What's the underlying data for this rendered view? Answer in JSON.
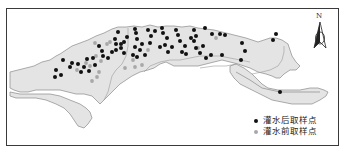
{
  "map": {
    "north_label": "N",
    "colors": {
      "region_fill": "#e4e4e4",
      "region_stroke": "#8a8a8a",
      "after_point": "#111111",
      "before_point": "#a8a8a8",
      "frame": "#3a3a3a"
    },
    "legend": [
      {
        "label": "灌水后取样点",
        "symbol": "black-dot",
        "color": "#111111"
      },
      {
        "label": "灌水前取样点",
        "symbol": "gray-dot",
        "color": "#a8a8a8"
      }
    ],
    "points_after": [
      [
        63,
        60
      ],
      [
        78,
        64
      ],
      [
        84,
        67
      ],
      [
        81,
        72
      ],
      [
        89,
        71
      ],
      [
        95,
        65
      ],
      [
        103,
        56
      ],
      [
        102,
        51
      ],
      [
        99,
        46
      ],
      [
        87,
        59
      ],
      [
        93,
        58
      ],
      [
        70,
        67
      ],
      [
        56,
        70
      ],
      [
        72,
        63
      ],
      [
        55,
        77
      ],
      [
        61,
        75
      ],
      [
        108,
        58
      ],
      [
        112,
        52
      ],
      [
        115,
        39
      ],
      [
        118,
        32
      ],
      [
        116,
        50
      ],
      [
        121,
        48
      ],
      [
        124,
        42
      ],
      [
        127,
        37
      ],
      [
        133,
        55
      ],
      [
        135,
        47
      ],
      [
        137,
        39
      ],
      [
        136,
        33
      ],
      [
        135,
        29
      ],
      [
        137,
        57
      ],
      [
        140,
        50
      ],
      [
        142,
        44
      ],
      [
        145,
        55
      ],
      [
        150,
        43
      ],
      [
        151,
        36
      ],
      [
        155,
        31
      ],
      [
        160,
        47
      ],
      [
        163,
        33
      ],
      [
        162,
        28
      ],
      [
        165,
        45
      ],
      [
        167,
        38
      ],
      [
        168,
        52
      ],
      [
        172,
        47
      ],
      [
        178,
        35
      ],
      [
        176,
        30
      ],
      [
        180,
        41
      ],
      [
        185,
        46
      ],
      [
        182,
        52
      ],
      [
        186,
        54
      ],
      [
        191,
        38
      ],
      [
        194,
        30
      ],
      [
        196,
        36
      ],
      [
        194,
        41
      ],
      [
        196,
        48
      ],
      [
        200,
        53
      ],
      [
        203,
        46
      ],
      [
        206,
        58
      ],
      [
        211,
        55
      ],
      [
        205,
        28
      ],
      [
        212,
        34
      ],
      [
        220,
        34
      ],
      [
        225,
        35
      ],
      [
        242,
        43
      ],
      [
        245,
        51
      ],
      [
        222,
        55
      ],
      [
        241,
        60
      ],
      [
        276,
        34
      ],
      [
        273,
        40
      ],
      [
        280,
        92
      ],
      [
        124,
        53
      ],
      [
        121,
        44
      ],
      [
        116,
        44
      ],
      [
        148,
        30
      ]
    ],
    "points_before": [
      [
        95,
        43
      ],
      [
        107,
        44
      ],
      [
        96,
        56
      ],
      [
        86,
        63
      ],
      [
        90,
        66
      ],
      [
        77,
        70
      ],
      [
        99,
        72
      ],
      [
        97,
        77
      ],
      [
        92,
        81
      ],
      [
        101,
        61
      ],
      [
        125,
        68
      ],
      [
        135,
        67
      ],
      [
        142,
        65
      ],
      [
        133,
        60
      ],
      [
        216,
        38
      ],
      [
        198,
        48
      ],
      [
        148,
        50
      ],
      [
        110,
        42
      ]
    ]
  }
}
